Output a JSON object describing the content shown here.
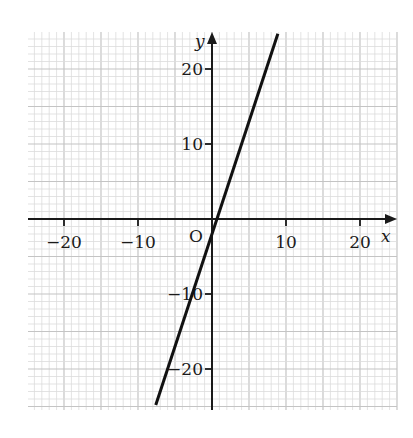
{
  "chart_data": {
    "type": "line",
    "title": "",
    "xlabel": "x",
    "ylabel": "y",
    "origin_label": "O",
    "xlim": [
      -25,
      25
    ],
    "ylim": [
      -26,
      25
    ],
    "x_ticks": [
      -20,
      -10,
      10,
      20
    ],
    "y_ticks": [
      -20,
      -10,
      10,
      20
    ],
    "x_tick_labels": [
      "−20",
      "−10",
      "10",
      "20"
    ],
    "y_tick_labels": [
      "−20",
      "−10",
      "10",
      "20"
    ],
    "grid": true,
    "grid_minor_step": 1,
    "grid_major_step": 5,
    "series": [
      {
        "name": "line",
        "equation": "y = 3x - 2",
        "x": [
          -7.6,
          8.9
        ],
        "y": [
          -24.8,
          24.7
        ],
        "color": "#111111"
      }
    ],
    "legend": null
  },
  "colors": {
    "grid_minor": "#dcdcdc",
    "grid_major": "#c4c4c4",
    "axis": "#1a1a1a",
    "line": "#111111"
  }
}
